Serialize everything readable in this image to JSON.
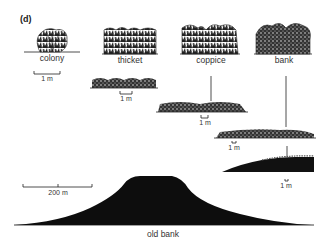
{
  "panel_label": "(d)",
  "stages": [
    {
      "name": "colony",
      "scale": "1 m"
    },
    {
      "name": "thicket",
      "scale": "1 m"
    },
    {
      "name": "coppice",
      "scale": "1 m"
    },
    {
      "name": "bank",
      "scale": "1 m"
    },
    {
      "name": "old bank",
      "scale": "200 m"
    }
  ],
  "colors": {
    "ink": "#111111",
    "background": "#ffffff"
  }
}
